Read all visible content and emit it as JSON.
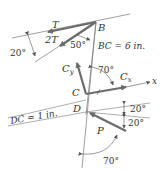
{
  "diagram": {
    "labels": {
      "T": "T",
      "two_T": "2T",
      "B": "B",
      "C": "C",
      "D": "D",
      "P": "P",
      "Cy": "C",
      "Cy_sub": "y",
      "Cx": "C",
      "Cx_sub": "x",
      "x_axis": "x",
      "bc_length": "BC = 6 in.",
      "dc_length": "DC = 1 in."
    },
    "angles": {
      "left_20": "20°",
      "angle_50": "50°",
      "angle_70_top": "70°",
      "right_20_upper": "20°",
      "right_20_lower": "20°",
      "angle_70_bottom": "70°"
    },
    "colors": {
      "line": "#555555",
      "force": "#6b6b6b",
      "text": "#333333"
    }
  }
}
